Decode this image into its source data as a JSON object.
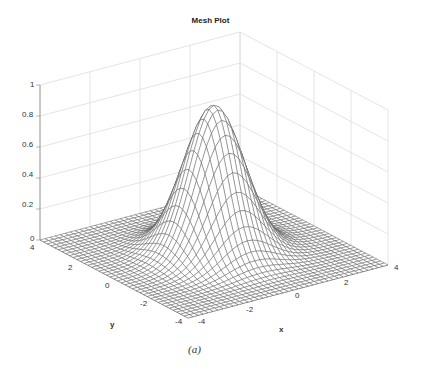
{
  "chart_data": {
    "type": "mesh3d",
    "title": "Mesh Plot",
    "caption": "(a)",
    "xlabel": "x",
    "ylabel": "y",
    "zlabel": "",
    "xlim": [
      -4,
      4
    ],
    "ylim": [
      -4,
      4
    ],
    "zlim": [
      0,
      1
    ],
    "xticks": [
      "-4",
      "-2",
      "0",
      "2",
      "4"
    ],
    "yticks": [
      "-4",
      "-2",
      "0",
      "2",
      "4"
    ],
    "zticks": [
      "0",
      "0.2",
      "0.4",
      "0.6",
      "0.8",
      "1"
    ],
    "grid": true,
    "function": "z = exp(-(x^2 + y^2) / 2)",
    "peak": {
      "x": 0,
      "y": 0,
      "z": 0.95
    },
    "mesh_resolution": 41,
    "colors": {
      "mesh": "#555555",
      "grid": "#dddddd",
      "axis": "#888888",
      "background": "#ffffff"
    }
  },
  "labels": {
    "title": "Mesh Plot",
    "caption": "(a)",
    "x_axis": "x",
    "y_axis": "y"
  }
}
